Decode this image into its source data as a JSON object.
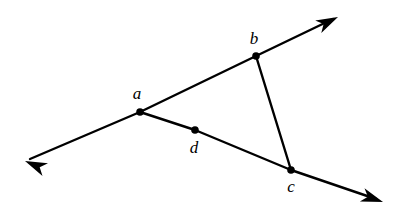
{
  "figure": {
    "type": "geometry-diagram",
    "background_color": "#ffffff",
    "stroke_color": "#000000",
    "stroke_width": 2.4,
    "point_radius": 3.8,
    "canvas": {
      "width": 405,
      "height": 217
    },
    "points": [
      {
        "id": "a",
        "label": "a",
        "x": 140,
        "y": 112,
        "label_x": 137,
        "label_y": 99,
        "dot": true
      },
      {
        "id": "b",
        "label": "b",
        "x": 256,
        "y": 56,
        "label_x": 254,
        "label_y": 44,
        "dot": true
      },
      {
        "id": "c",
        "label": "c",
        "x": 291,
        "y": 170,
        "label_x": 291,
        "label_y": 192,
        "dot": true
      },
      {
        "id": "d",
        "label": "d",
        "x": 195,
        "y": 130,
        "label_x": 194,
        "label_y": 153,
        "dot": true
      }
    ],
    "rays": [
      {
        "id": "ray-upper",
        "name": "ray-through-a-and-b",
        "path": "M 30 159 L 140 112 L 256 56 L 333 19",
        "arrow_start": {
          "tip_x": 25,
          "tip_y": 161,
          "angle_deg": 203
        },
        "arrow_end": {
          "tip_x": 338,
          "tip_y": 17,
          "angle_deg": 334
        }
      },
      {
        "id": "ray-lower",
        "name": "ray-through-a-d-and-c",
        "path": "M 140 112 L 195 130 L 291 170 L 376 199",
        "arrow_start": null,
        "arrow_end": {
          "tip_x": 383,
          "tip_y": 202,
          "angle_deg": 19
        }
      }
    ],
    "segments": [
      {
        "id": "seg-bc",
        "name": "segment-b-to-c",
        "from": "b",
        "to": "c",
        "path": "M 256 56 L 291 170"
      }
    ],
    "arrowheads": {
      "style": "barbed",
      "length": 22,
      "half_width": 7,
      "notch": 6
    }
  }
}
